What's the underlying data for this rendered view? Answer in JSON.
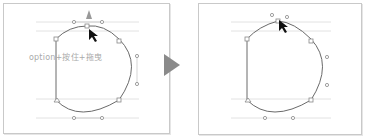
{
  "left_panel": {
    "caption": "option+按住+拖曳",
    "description": "Drag top anchor point with option key to convert to corner point"
  },
  "right_panel": {
    "description": "Result: top anchor point converted"
  },
  "transition_arrow": "triangle-right",
  "colors": {
    "path_stroke": "#666666",
    "guide_line": "#dddddd",
    "handle": "#888888",
    "arrow": "#8a8a8a",
    "caption": "#aaaaaa"
  }
}
